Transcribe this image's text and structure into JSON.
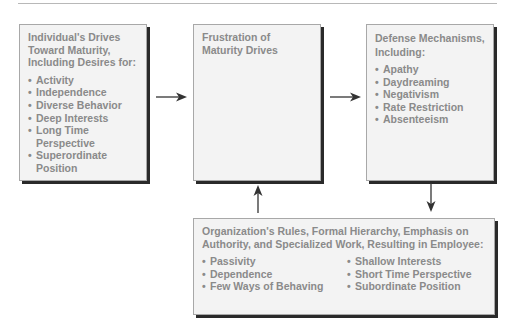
{
  "diagram": {
    "boxes": {
      "drives": {
        "title": "Individual's Drives Toward Maturity, Including Desires for:",
        "items": [
          "Activity",
          "Independence",
          "Diverse Behavior",
          "Deep Interests",
          "Long Time Perspective",
          "Superordinate Position"
        ]
      },
      "frustration": {
        "title": "Frustration of Maturity Drives"
      },
      "defense": {
        "title": "Defense Mechanisms, Including:",
        "items": [
          "Apathy",
          "Daydreaming",
          "Negativism",
          "Rate Restriction",
          "Absenteeism"
        ]
      },
      "organization": {
        "title": "Organization's Rules, Formal Hierarchy, Emphasis on Authority, and Specialized Work, Resulting in Employee:",
        "items_left": [
          "Passivity",
          "Dependence",
          "Few Ways of Behaving"
        ],
        "items_right": [
          "Shallow Interests",
          "Short Time Perspective",
          "Subordinate Position"
        ]
      }
    },
    "arrows": [
      {
        "from": "drives",
        "to": "frustration",
        "direction": "right"
      },
      {
        "from": "frustration",
        "to": "defense",
        "direction": "right"
      },
      {
        "from": "defense",
        "to": "organization",
        "direction": "down"
      },
      {
        "from": "organization",
        "to": "frustration",
        "direction": "up"
      }
    ],
    "colors": {
      "text": "#8a8a8a",
      "box_fill": "#f3f3f3",
      "box_border": "#a8a8a8",
      "shadow": "#2a2a2a",
      "arrow": "#333333"
    }
  }
}
